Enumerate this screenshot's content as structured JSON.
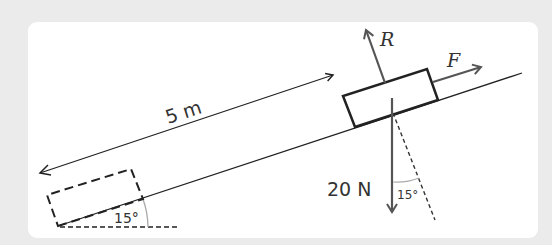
{
  "diagram": {
    "distance_label": "5 m",
    "incline_angle_label": "15°",
    "weight_label": "20 N",
    "weight_angle_label": "15°",
    "reaction_label": "R",
    "force_label": "F",
    "colors": {
      "background": "#ebebeb",
      "panel": "#ffffff",
      "stroke": "#222222",
      "force_arrows": "#555555",
      "angle_arc": "#aaaaaa"
    },
    "elements": [
      {
        "name": "inclined-plane",
        "type": "line"
      },
      {
        "name": "start-position-block",
        "type": "dashed-rectangle"
      },
      {
        "name": "current-position-block",
        "type": "rectangle"
      },
      {
        "name": "distance-arrow",
        "type": "double-arrow",
        "label": "5 m"
      },
      {
        "name": "reaction-force-arrow",
        "label": "R"
      },
      {
        "name": "applied-force-arrow",
        "label": "F"
      },
      {
        "name": "weight-arrow",
        "label": "20 N"
      },
      {
        "name": "normal-dashed-line"
      },
      {
        "name": "incline-angle",
        "label": "15°"
      },
      {
        "name": "weight-angle",
        "label": "15°"
      }
    ]
  }
}
